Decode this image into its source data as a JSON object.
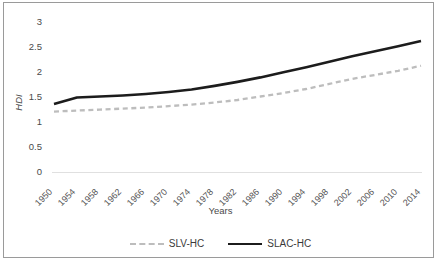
{
  "chart_data": {
    "type": "line",
    "title": "",
    "xlabel": "Years",
    "ylabel": "HDI",
    "ylim": [
      0,
      3
    ],
    "yticks": [
      "0",
      "0.5",
      "1",
      "1.5",
      "2",
      "2.5",
      "3"
    ],
    "grid": false,
    "legend_position": "bottom",
    "categories": [
      "1950",
      "1954",
      "1958",
      "1962",
      "1966",
      "1970",
      "1974",
      "1978",
      "1982",
      "1986",
      "1990",
      "1994",
      "1998",
      "2002",
      "2006",
      "2010",
      "2014"
    ],
    "x": [
      1950,
      1954,
      1958,
      1962,
      1966,
      1970,
      1974,
      1978,
      1982,
      1986,
      1990,
      1994,
      1998,
      2002,
      2006,
      2010,
      2014
    ],
    "series": [
      {
        "name": "SLV-HC",
        "style": "dashed",
        "color": "#bdbdbd",
        "values": [
          1.2,
          1.22,
          1.24,
          1.26,
          1.28,
          1.31,
          1.34,
          1.38,
          1.43,
          1.5,
          1.57,
          1.65,
          1.75,
          1.85,
          1.93,
          2.01,
          2.11
        ]
      },
      {
        "name": "SLAC-HC",
        "style": "solid",
        "color": "#1c1c1c",
        "values": [
          1.35,
          1.48,
          1.5,
          1.52,
          1.55,
          1.59,
          1.64,
          1.71,
          1.79,
          1.88,
          1.98,
          2.08,
          2.19,
          2.3,
          2.4,
          2.5,
          2.6
        ]
      }
    ]
  },
  "axes": {
    "y_title": "HDI",
    "x_title": "Years",
    "y_ticks": [
      "3",
      "2.5",
      "2",
      "1.5",
      "1",
      "0.5",
      "0"
    ],
    "x_ticks": [
      "1950",
      "1954",
      "1958",
      "1962",
      "1966",
      "1970",
      "1974",
      "1978",
      "1982",
      "1986",
      "1990",
      "1994",
      "1998",
      "2002",
      "2006",
      "2010",
      "2014"
    ]
  },
  "legend": {
    "items": [
      {
        "label": "SLV-HC",
        "style": "dashed",
        "color": "#bdbdbd"
      },
      {
        "label": "SLAC-HC",
        "style": "solid",
        "color": "#1c1c1c"
      }
    ]
  }
}
